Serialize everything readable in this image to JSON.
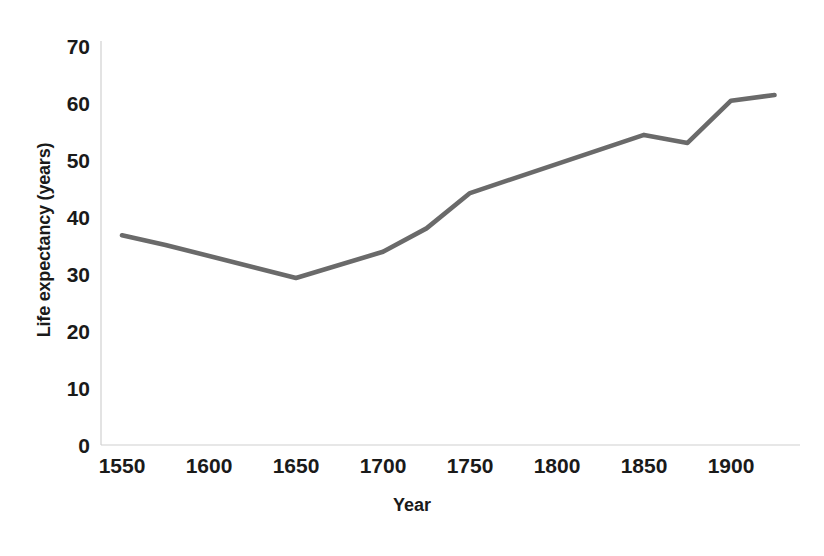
{
  "chart_data": {
    "type": "line",
    "title": "",
    "xlabel": "Year",
    "ylabel": "Life expectancy (years)",
    "xlim": [
      1550,
      1930
    ],
    "ylim": [
      0,
      70
    ],
    "xticks": [
      1550,
      1600,
      1650,
      1700,
      1750,
      1800,
      1850,
      1900
    ],
    "yticks": [
      0,
      10,
      20,
      30,
      40,
      50,
      60,
      70
    ],
    "xtick_labels": [
      "1550",
      "1600",
      "1650",
      "1700",
      "1750",
      "1800",
      "1850",
      "1900"
    ],
    "ytick_labels": [
      "0",
      "10",
      "20",
      "30",
      "40",
      "50",
      "60",
      "70"
    ],
    "grid": false,
    "legend": null,
    "series": [
      {
        "name": "Life expectancy",
        "color": "#6a6a6a",
        "line_width": 4.6,
        "x": [
          1550,
          1575,
          1650,
          1700,
          1725,
          1750,
          1850,
          1875,
          1900,
          1925
        ],
        "y": [
          36.8,
          35.1,
          29.3,
          33.9,
          38.0,
          44.2,
          54.4,
          53.0,
          60.4,
          61.4
        ]
      }
    ]
  },
  "axes": {
    "axis_color": "#d0d0d0"
  }
}
